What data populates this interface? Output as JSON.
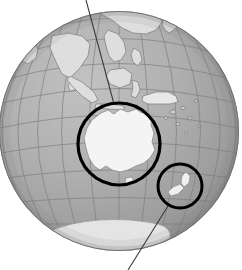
{
  "figure": {
    "name": "globe-locator-map",
    "projection": "orthographic",
    "background_color": "#ffffff"
  },
  "globe": {
    "center_x": 119,
    "center_y": 131,
    "radius": 120,
    "ocean_color_light": "#b4b4b4",
    "ocean_color_dark": "#8e8e8e",
    "outline_color": "#6f6f6f",
    "land_color": "#f2f2f2",
    "land_outline_color": "#7a7a7a",
    "graticule_color": "#7d7d7d",
    "graticule_spacing_degrees": 15,
    "center_longitude": 135,
    "center_latitude": -10
  },
  "landmasses": [
    {
      "name": "australia",
      "label": "Australia"
    },
    {
      "name": "new-zealand",
      "label": "New Zealand"
    },
    {
      "name": "indonesia",
      "label": "Indonesia"
    },
    {
      "name": "new-guinea",
      "label": "New Guinea"
    },
    {
      "name": "southeast-asia",
      "label": "Southeast Asia"
    },
    {
      "name": "india",
      "label": "India"
    },
    {
      "name": "china",
      "label": "China"
    },
    {
      "name": "japan",
      "label": "Japan"
    },
    {
      "name": "philippines",
      "label": "Philippines"
    },
    {
      "name": "antarctica",
      "label": "Antarctica"
    }
  ],
  "annotations": {
    "circles": [
      {
        "name": "australia-highlight-circle",
        "target": "Australia",
        "cx": 119,
        "cy": 144,
        "r": 41,
        "stroke_color": "#000000",
        "stroke_width": 3.2
      },
      {
        "name": "new-zealand-highlight-circle",
        "target": "New Zealand",
        "cx": 180,
        "cy": 186,
        "r": 22,
        "stroke_color": "#000000",
        "stroke_width": 3.0
      }
    ],
    "leader_lines": [
      {
        "name": "australia-leader-line",
        "from_x": 86,
        "from_y": 0,
        "to_x": 114,
        "to_y": 104,
        "stroke_color": "#3a3a3a",
        "stroke_width": 1.1
      },
      {
        "name": "new-zealand-leader-line",
        "from_x": 168,
        "from_y": 206,
        "to_x": 128,
        "to_y": 270,
        "stroke_color": "#3a3a3a",
        "stroke_width": 1.1
      }
    ]
  }
}
